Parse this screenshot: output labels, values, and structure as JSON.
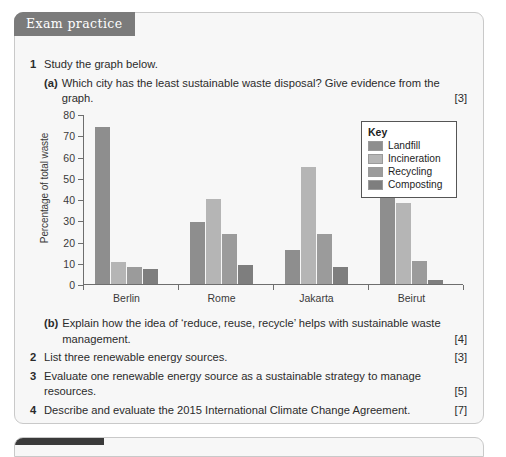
{
  "header": {
    "banner_label": "Exam practice"
  },
  "questions": [
    {
      "number": "1",
      "stem": "Study the graph below.",
      "parts": [
        {
          "label": "(a)",
          "text": "Which city has the least sustainable waste disposal? Give evidence from the graph.",
          "marks": "[3]"
        },
        {
          "label": "(b)",
          "text": "Explain how the idea of ‘reduce, reuse, recycle’ helps with sustainable waste management.",
          "marks": "[4]"
        }
      ]
    },
    {
      "number": "2",
      "stem": "List three renewable energy sources.",
      "marks": "[3]"
    },
    {
      "number": "3",
      "stem": "Evaluate one renewable energy source as a sustainable strategy to manage resources.",
      "marks": "[5]"
    },
    {
      "number": "4",
      "stem": "Describe and evaluate the 2015 International Climate Change Agreement.",
      "marks": "[7]"
    }
  ],
  "legend": {
    "title": "Key",
    "items": [
      {
        "label": "Landfill",
        "color": "#8e8e8e"
      },
      {
        "label": "Incineration",
        "color": "#b5b5b5"
      },
      {
        "label": "Recycling",
        "color": "#9b9b9b"
      },
      {
        "label": "Composting",
        "color": "#7e7e7e"
      }
    ]
  },
  "chart_data": {
    "type": "bar",
    "title": "",
    "xlabel": "",
    "ylabel": "Percentage of total waste",
    "ylim": [
      0,
      80
    ],
    "yticks": [
      0,
      10,
      20,
      30,
      40,
      50,
      60,
      70,
      80
    ],
    "ytick_labels": [
      "0",
      "10",
      "20",
      "30",
      "40",
      "50",
      "60",
      "70",
      "80"
    ],
    "grid": false,
    "legend_position": "inside-top-right",
    "categories": [
      "Berlin",
      "Rome",
      "Jakarta",
      "Beirut"
    ],
    "series": [
      {
        "name": "Landfill",
        "color": "#8e8e8e",
        "values": [
          74,
          29,
          16,
          49
        ]
      },
      {
        "name": "Incineration",
        "color": "#b5b5b5",
        "values": [
          10.5,
          40,
          55,
          38
        ]
      },
      {
        "name": "Recycling",
        "color": "#9b9b9b",
        "values": [
          8,
          23.5,
          23.5,
          11
        ]
      },
      {
        "name": "Composting",
        "color": "#7e7e7e",
        "values": [
          7,
          9,
          8,
          2
        ]
      }
    ]
  }
}
